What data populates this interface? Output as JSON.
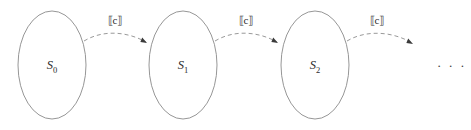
{
  "diagram": {
    "type": "state-transition-chain",
    "title": "",
    "background_color": "#ffffff",
    "stroke_color": "#8a8a8a",
    "text_color": "#2b2b2b",
    "arrow_color": "#3a3a3a",
    "states": [
      {
        "id": "s0",
        "base": "S",
        "subscript": "0",
        "cx": 52,
        "cy": 65,
        "rx": 34,
        "ry": 54
      },
      {
        "id": "s1",
        "base": "S",
        "subscript": "1",
        "cx": 183,
        "cy": 65,
        "rx": 34,
        "ry": 54
      },
      {
        "id": "s2",
        "base": "S",
        "subscript": "2",
        "cx": 315,
        "cy": 65,
        "rx": 34,
        "ry": 54
      }
    ],
    "transitions": [
      {
        "id": "t0",
        "from": "s0",
        "to": "s1",
        "label": "⟦c⟧",
        "label_x": 115,
        "label_y": 24,
        "path": "M 84,41 C 104,29 128,32 146,42",
        "arrow_x": 147,
        "arrow_y": 43,
        "arrow_angle": 32,
        "style": "dashed"
      },
      {
        "id": "t1",
        "from": "s1",
        "to": "s2",
        "label": "⟦c⟧",
        "label_x": 246,
        "label_y": 24,
        "path": "M 215,41 C 235,29 259,32 277,42",
        "arrow_x": 278,
        "arrow_y": 43,
        "arrow_angle": 32,
        "style": "dashed"
      },
      {
        "id": "t2",
        "from": "s2",
        "to": "ellipsis",
        "label": "⟦c⟧",
        "label_x": 377,
        "label_y": 24,
        "path": "M 347,41 C 367,29 394,32 412,43",
        "arrow_x": 413,
        "arrow_y": 44,
        "arrow_angle": 32,
        "style": "dashed"
      }
    ],
    "ellipsis": {
      "text": "· · ·",
      "x": 437,
      "y": 70
    }
  }
}
